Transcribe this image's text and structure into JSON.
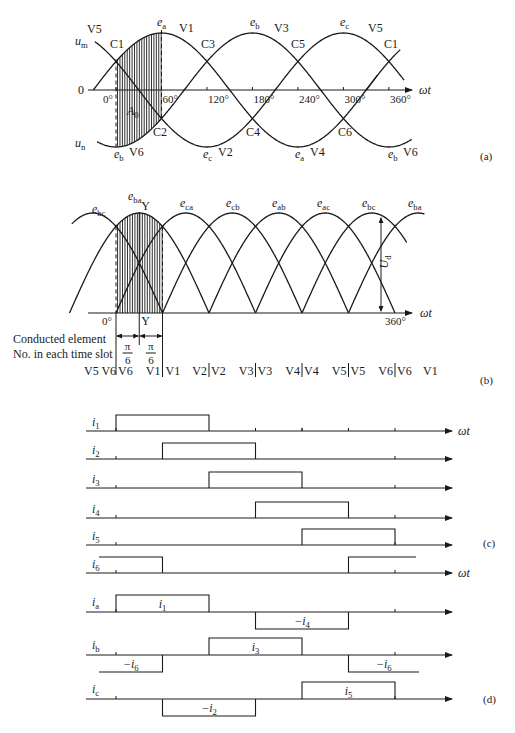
{
  "panel_a": {
    "label": "(a)",
    "axis_label": "ωt",
    "origin_label": "0",
    "upper_envelope_label": "u",
    "upper_envelope_sub": "m",
    "lower_envelope_label": "u",
    "lower_envelope_sub": "n",
    "area_label": "A",
    "area_sub": "0",
    "ticks": [
      "0°",
      "60°",
      "120°",
      "180°",
      "240°",
      "300°",
      "360°"
    ],
    "top_labels": [
      {
        "text": "V5"
      },
      {
        "e": "e",
        "sub": "a"
      },
      {
        "text": "V1"
      },
      {
        "e": "e",
        "sub": "b"
      },
      {
        "text": "V3"
      },
      {
        "e": "e",
        "sub": "c"
      },
      {
        "text": "V5"
      }
    ],
    "crossing_labels_top": [
      "C1",
      "C3",
      "C5",
      "C1"
    ],
    "crossing_labels_bottom": [
      "C2",
      "C4",
      "C6"
    ],
    "bottom_labels": [
      {
        "e": "e",
        "sub": "b",
        "v": "V6"
      },
      {
        "e": "e",
        "sub": "c",
        "v": "V2"
      },
      {
        "e": "e",
        "sub": "a",
        "v": "V4"
      },
      {
        "e": "e",
        "sub": "b",
        "v": "V6"
      }
    ]
  },
  "panel_b": {
    "label": "(b)",
    "axis_label": "ωt",
    "tick_0": "0°",
    "tick_360": "360°",
    "marker": "Y",
    "ud_label": "U",
    "ud_sub": "d",
    "pi_over_6": {
      "num": "π",
      "den": "6"
    },
    "line_voltages": [
      {
        "e": "e",
        "sub": "bc"
      },
      {
        "e": "e",
        "sub": "ba"
      },
      {
        "e": "e",
        "sub": "ca"
      },
      {
        "e": "e",
        "sub": "cb"
      },
      {
        "e": "e",
        "sub": "ab"
      },
      {
        "e": "e",
        "sub": "ac"
      },
      {
        "e": "e",
        "sub": "bc"
      },
      {
        "e": "e",
        "sub": "ba"
      }
    ],
    "caption_line1": "Conducted element",
    "caption_line2": "No. in each time slot",
    "conduction_row": [
      "V5 V6",
      "V6",
      "V1",
      "V1",
      "V2",
      "V2",
      "V3",
      "V3",
      "V4",
      "V4",
      "V5",
      "V5",
      "V6",
      "V6",
      "V1"
    ]
  },
  "panel_c": {
    "label": "(c)",
    "axis_label": "ωt",
    "rows": [
      {
        "name": "i",
        "sub": "1",
        "on": [
          [
            0,
            120
          ]
        ]
      },
      {
        "name": "i",
        "sub": "2",
        "on": [
          [
            60,
            180
          ]
        ]
      },
      {
        "name": "i",
        "sub": "3",
        "on": [
          [
            120,
            240
          ]
        ]
      },
      {
        "name": "i",
        "sub": "4",
        "on": [
          [
            180,
            300
          ]
        ]
      },
      {
        "name": "i",
        "sub": "5",
        "on": [
          [
            240,
            360
          ]
        ]
      },
      {
        "name": "i",
        "sub": "6",
        "on": [
          [
            -60,
            60
          ],
          [
            300,
            420
          ]
        ]
      }
    ]
  },
  "panel_d": {
    "label": "(d)",
    "rows": [
      {
        "name": "i",
        "sub": "a",
        "pos": {
          "label": "i",
          "sub": "1",
          "range": [
            0,
            120
          ]
        },
        "neg": {
          "label": "−i",
          "sub": "4",
          "range": [
            180,
            300
          ]
        }
      },
      {
        "name": "i",
        "sub": "b",
        "pos": {
          "label": "i",
          "sub": "3",
          "range": [
            120,
            240
          ]
        },
        "neg": [
          {
            "label": "−i",
            "sub": "6",
            "range": [
              -60,
              60
            ]
          },
          {
            "label": "−i",
            "sub": "6",
            "range": [
              300,
              420
            ]
          }
        ]
      },
      {
        "name": "i",
        "sub": "c",
        "pos": {
          "label": "i",
          "sub": "5",
          "range": [
            240,
            360
          ]
        },
        "neg": {
          "label": "−i",
          "sub": "2",
          "range": [
            60,
            180
          ]
        }
      }
    ]
  },
  "colors": {
    "ink": "#1a1a1a",
    "background": "#ffffff"
  }
}
